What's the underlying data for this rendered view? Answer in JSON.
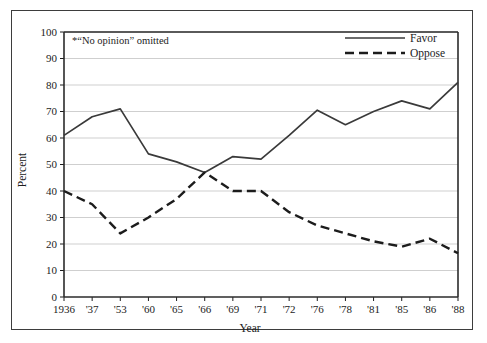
{
  "chart_data": {
    "type": "line",
    "title": "",
    "xlabel": "Year",
    "ylabel": "Percent",
    "categories": [
      "1936",
      "'37",
      "'53",
      "'60",
      "'65",
      "'66",
      "'69",
      "'71",
      "'72",
      "'76",
      "'78",
      "'81",
      "'85",
      "'86",
      "'88"
    ],
    "series": [
      {
        "name": "Favor",
        "style": "solid",
        "color": "#3a3a3a",
        "values": [
          61,
          68,
          71,
          54,
          51,
          47,
          53,
          52,
          61,
          70.5,
          65,
          70,
          74,
          71,
          81
        ]
      },
      {
        "name": "Oppose",
        "style": "dashed",
        "color": "#1c1c1c",
        "values": [
          40,
          35,
          24,
          30,
          37,
          47,
          40,
          40,
          32,
          27,
          24,
          21,
          19,
          22,
          16.5
        ]
      }
    ],
    "ylim": [
      0,
      100
    ],
    "ytick_step": 10,
    "yticks": [
      "0",
      "10",
      "20",
      "30",
      "40",
      "50",
      "60",
      "70",
      "80",
      "90",
      "100"
    ],
    "grid": true,
    "grid_color": "#cfcfcf",
    "legend_position": "top-right",
    "annotation": "*“No opinion” omitted"
  },
  "frame": {
    "border_color": "#3d3d3d"
  },
  "axis": {
    "x_title": "Year",
    "y_title": "Percent"
  },
  "legend": {
    "items": [
      {
        "label": "Favor"
      },
      {
        "label": "Oppose"
      }
    ]
  }
}
